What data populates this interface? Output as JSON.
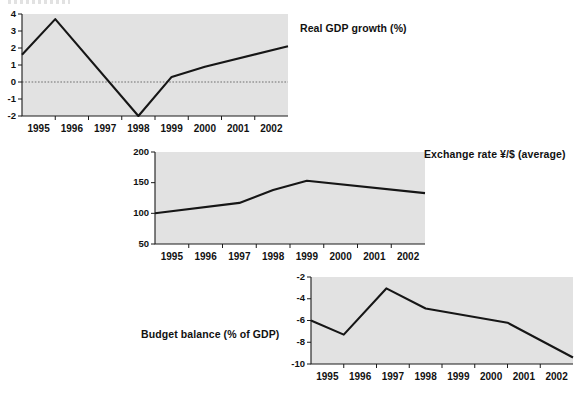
{
  "page": {
    "background_color": "#ffffff",
    "plot_background_color": "#e2e2e2",
    "line_color": "#161616"
  },
  "charts": [
    {
      "id": "real-gdp-growth",
      "title": "Real GDP growth (%)",
      "title_position": "right",
      "chart_data": {
        "type": "line",
        "title": "Real GDP growth (%)",
        "xlabel": "",
        "ylabel": "",
        "xlim": [
          1994.5,
          2002.5
        ],
        "ylim": [
          -2,
          4
        ],
        "yticks": [
          -2,
          -1,
          0,
          1,
          2,
          3,
          4
        ],
        "ytick_labels": [
          "-2",
          "-1",
          "0",
          "1",
          "2",
          "3",
          "4"
        ],
        "xticks": [
          1995,
          1996,
          1997,
          1998,
          1999,
          2000,
          2001,
          2002
        ],
        "xtick_labels": [
          "1995",
          "1996",
          "1997",
          "1998",
          "1999",
          "2000",
          "2001",
          "2002"
        ],
        "grid": false,
        "zero_reference_line": 0,
        "series": [
          {
            "name": "Real GDP growth",
            "x": [
              1994.5,
              1995.5,
              1998.0,
              1999.0,
              2000.0,
              2002.5
            ],
            "values": [
              1.6,
              3.7,
              -2.0,
              0.3,
              0.9,
              2.1
            ]
          }
        ]
      }
    },
    {
      "id": "exchange-rate",
      "title": "Exchange rate ¥/$ (average)",
      "title_position": "right",
      "chart_data": {
        "type": "line",
        "title": "Exchange rate ¥/$ (average)",
        "xlabel": "",
        "ylabel": "",
        "xlim": [
          1994.5,
          2002.5
        ],
        "ylim": [
          50,
          200
        ],
        "yticks": [
          50,
          100,
          150,
          200
        ],
        "ytick_labels": [
          "50",
          "100",
          "150",
          "200"
        ],
        "xticks": [
          1995,
          1996,
          1997,
          1998,
          1999,
          2000,
          2001,
          2002
        ],
        "xtick_labels": [
          "1995",
          "1996",
          "1997",
          "1998",
          "1999",
          "2000",
          "2001",
          "2002"
        ],
        "grid": false,
        "series": [
          {
            "name": "Exchange rate yen per dollar",
            "x": [
              1994.5,
              1997.0,
              1998.0,
              1999.0,
              2002.5
            ],
            "values": [
              100,
              117,
              138,
              153,
              133
            ]
          }
        ]
      }
    },
    {
      "id": "budget-balance",
      "title": "Budget balance (% of GDP)",
      "title_position": "left",
      "chart_data": {
        "type": "line",
        "title": "Budget balance (% of GDP)",
        "xlabel": "",
        "ylabel": "",
        "xlim": [
          1994.5,
          2002.5
        ],
        "ylim": [
          -10,
          -2
        ],
        "yticks": [
          -10,
          -8,
          -6,
          -4,
          -2
        ],
        "ytick_labels": [
          "-10",
          "-8",
          "-6",
          "-4",
          "-2"
        ],
        "xticks": [
          1995,
          1996,
          1997,
          1998,
          1999,
          2000,
          2001,
          2002
        ],
        "xtick_labels": [
          "1995",
          "1996",
          "1997",
          "1998",
          "1999",
          "2000",
          "2001",
          "2002"
        ],
        "grid": false,
        "series": [
          {
            "name": "Budget balance",
            "x": [
              1994.5,
              1995.5,
              1996.8,
              1998.0,
              2000.5,
              2002.5
            ],
            "values": [
              -6.0,
              -7.3,
              -3.05,
              -4.9,
              -6.2,
              -9.4
            ]
          }
        ]
      }
    }
  ]
}
